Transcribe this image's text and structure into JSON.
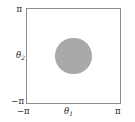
{
  "chart_data": {
    "type": "scatter",
    "title": "",
    "xlabel": "θ₁",
    "ylabel": "θ₂",
    "xlim": [
      -3.14159,
      3.14159
    ],
    "ylim": [
      -3.14159,
      3.14159
    ],
    "xticks": [
      "−π",
      "π"
    ],
    "yticks": [
      "−π",
      "π"
    ],
    "grid": false,
    "legend": null,
    "regions": [
      {
        "name": "shaded-disc",
        "shape": "circle",
        "center_x": 0.0,
        "center_y": 0.0,
        "radius": 1.22,
        "fill": "#a9a9a9"
      }
    ]
  },
  "axes": {
    "x": {
      "label_main": "θ",
      "label_sub": "1",
      "tick_min": "−π",
      "tick_max": "π"
    },
    "y": {
      "label_main": "θ",
      "label_sub": "2",
      "tick_min": "−π",
      "tick_max": "π"
    }
  },
  "style": {
    "frame_color": "#8d8d8d",
    "disc_color": "#a9a9a9",
    "text_color": "#1c1c1c",
    "background": "#ffffff"
  }
}
